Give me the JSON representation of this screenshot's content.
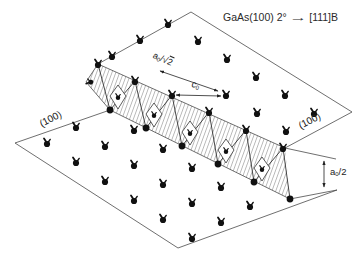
{
  "title": {
    "system": "GaAs(100) 2°",
    "arrow": "→",
    "target": "[111]B"
  },
  "labels": {
    "lattice_spacing": {
      "base": "a",
      "sub": "0",
      "slash_radical": "/√",
      "radicand": "2"
    },
    "dimer_spacing": {
      "base": "c",
      "sub": "0",
      "rest": ""
    },
    "step_height": {
      "base": "a",
      "sub": "0",
      "rest": "/2"
    },
    "plane_left": "(100)",
    "plane_right": "(100)"
  },
  "colors": {
    "background": "#ffffff",
    "edge_line": "#4a4a4a",
    "detail_line": "#333333",
    "atom": "#111111",
    "hatch": "#3a3a3a",
    "arrow": "#222222",
    "text": "#222222"
  },
  "geometry": {
    "edges": [
      [
        98,
        64,
        191,
        12
      ],
      [
        191,
        12,
        352,
        112
      ],
      [
        352,
        112,
        285,
        148
      ],
      [
        98,
        64,
        285,
        148
      ],
      [
        285,
        148,
        336,
        159
      ],
      [
        15,
        143,
        110,
        110
      ],
      [
        110,
        110,
        290,
        199
      ],
      [
        290,
        199,
        337,
        190
      ],
      [
        337,
        190,
        178,
        248
      ],
      [
        178,
        248,
        15,
        143
      ],
      [
        98,
        64,
        86,
        82
      ],
      [
        86,
        82,
        110,
        110
      ]
    ],
    "band_polygon": "98,64 285,148 290,199 110,110 86,82",
    "band": {
      "top_atoms": [
        [
          98,
          64
        ],
        [
          135,
          81
        ],
        [
          172,
          95
        ],
        [
          209,
          112
        ],
        [
          246,
          130
        ],
        [
          283,
          148
        ]
      ],
      "bottom_dots": [
        [
          110,
          110
        ],
        [
          146,
          128
        ],
        [
          182,
          146
        ],
        [
          218,
          164
        ],
        [
          254,
          182
        ],
        [
          290,
          199
        ]
      ],
      "inner_atoms": [
        [
          118,
          97
        ],
        [
          154,
          115
        ],
        [
          190,
          133
        ],
        [
          226,
          151
        ],
        [
          262,
          169
        ]
      ]
    },
    "upper_edge_atoms": [
      [
        112,
        56
      ],
      [
        140,
        40
      ],
      [
        168,
        24
      ]
    ],
    "upper_field_atoms": [
      [
        198,
        41
      ],
      [
        227,
        59
      ],
      [
        256,
        77
      ],
      [
        285,
        95
      ],
      [
        314,
        113
      ],
      [
        226,
        95
      ],
      [
        257,
        113
      ],
      [
        286,
        131
      ]
    ],
    "lower_field_atoms": [
      [
        47,
        143
      ],
      [
        76,
        127
      ],
      [
        76,
        162
      ],
      [
        105,
        146
      ],
      [
        134,
        130
      ],
      [
        105,
        181
      ],
      [
        134,
        165
      ],
      [
        163,
        149
      ],
      [
        134,
        200
      ],
      [
        163,
        184
      ],
      [
        192,
        168
      ],
      [
        163,
        219
      ],
      [
        192,
        203
      ],
      [
        221,
        187
      ],
      [
        192,
        238
      ],
      [
        221,
        222
      ],
      [
        250,
        206
      ]
    ],
    "tip_marker": [
      90,
      82
    ],
    "arrows": [
      {
        "name": "a0-sqrt2-arrow",
        "x1": 160,
        "y1": 71,
        "x2": 218,
        "y2": 91
      },
      {
        "name": "c0-arrow",
        "x1": 176,
        "y1": 95,
        "x2": 221,
        "y2": 96
      },
      {
        "name": "a0-half-arrow",
        "x1": 324,
        "y1": 161,
        "x2": 324,
        "y2": 187
      }
    ]
  }
}
